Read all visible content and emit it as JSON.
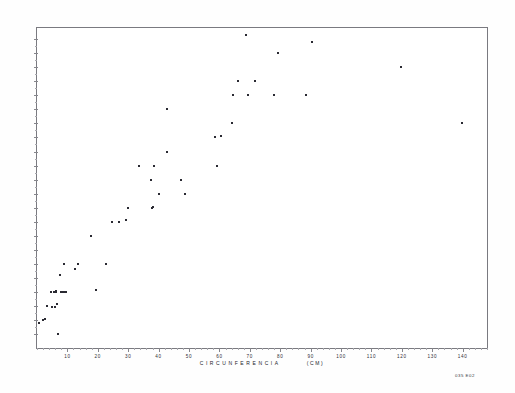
{
  "chart_data": {
    "type": "scatter",
    "title": "",
    "xlabel": "CIRCUNFERENCIA",
    "xunit": "(CM)",
    "ylabel": "",
    "xlim": [
      0,
      148
    ],
    "ylim": [
      0,
      22.8
    ],
    "grid": false,
    "legend": null,
    "xticks": [
      10,
      20,
      30,
      40,
      50,
      60,
      70,
      80,
      90,
      100,
      110,
      120,
      130,
      140
    ],
    "yticks": [
      1,
      2,
      3,
      4,
      5,
      6,
      7,
      8,
      9,
      10,
      11,
      12,
      13,
      14,
      15,
      16,
      17,
      18,
      19,
      20,
      21,
      22
    ],
    "xticklabels": [
      "10",
      "20",
      "30",
      "40",
      "50",
      "60",
      "70",
      "80",
      "90",
      "100",
      "110",
      "120",
      "130",
      "140"
    ],
    "yticklabels": [
      "1",
      "2",
      "3",
      "4",
      "5",
      "6",
      "7",
      "8",
      "9",
      "10",
      "11",
      "12",
      "13",
      "14",
      "15",
      "16",
      "17",
      "18",
      "19",
      "20",
      "21",
      "22"
    ],
    "points": [
      [
        0.6,
        1.8
      ],
      [
        2.0,
        2.0
      ],
      [
        2.6,
        2.1
      ],
      [
        3.4,
        3.0
      ],
      [
        4.6,
        4.0
      ],
      [
        5.0,
        2.9
      ],
      [
        5.6,
        4.0
      ],
      [
        5.8,
        2.9
      ],
      [
        6.2,
        4.0
      ],
      [
        6.4,
        4.05
      ],
      [
        6.6,
        3.1
      ],
      [
        6.8,
        1.0
      ],
      [
        7.4,
        5.2
      ],
      [
        7.8,
        4.0
      ],
      [
        8.4,
        4.0
      ],
      [
        8.8,
        6.0
      ],
      [
        9.2,
        4.0
      ],
      [
        9.6,
        4.0
      ],
      [
        12.4,
        5.6
      ],
      [
        13.4,
        6.0
      ],
      [
        17.6,
        8.0
      ],
      [
        19.4,
        4.1
      ],
      [
        22.6,
        6.0
      ],
      [
        24.6,
        9.0
      ],
      [
        27.0,
        9.0
      ],
      [
        29.4,
        9.1
      ],
      [
        29.8,
        10.0
      ],
      [
        33.6,
        13.0
      ],
      [
        37.4,
        12.0
      ],
      [
        37.8,
        10.0
      ],
      [
        38.2,
        10.05
      ],
      [
        38.6,
        13.0
      ],
      [
        40.2,
        11.0
      ],
      [
        42.6,
        14.0
      ],
      [
        42.8,
        17.0
      ],
      [
        47.2,
        12.0
      ],
      [
        48.6,
        11.0
      ],
      [
        58.6,
        15.0
      ],
      [
        59.2,
        13.0
      ],
      [
        60.6,
        15.1
      ],
      [
        64.2,
        16.0
      ],
      [
        64.6,
        18.0
      ],
      [
        66.2,
        19.0
      ],
      [
        68.8,
        22.3
      ],
      [
        69.4,
        18.0
      ],
      [
        71.6,
        19.0
      ],
      [
        78.0,
        18.0
      ],
      [
        79.4,
        21.0
      ],
      [
        88.6,
        18.0
      ],
      [
        90.4,
        21.8
      ],
      [
        119.6,
        20.0
      ],
      [
        139.8,
        16.0
      ]
    ]
  },
  "corner_stamp": "035 E02"
}
